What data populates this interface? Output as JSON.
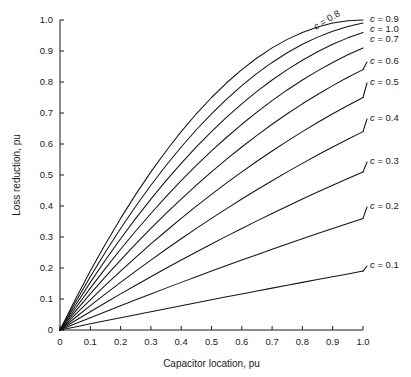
{
  "chart_data": {
    "type": "line",
    "title": "",
    "xlabel": "Capacitor location, pu",
    "ylabel": "Loss reduction, pu",
    "xlim": [
      0,
      1.0
    ],
    "ylim": [
      0,
      1.0
    ],
    "grid": false,
    "legend_position": "right-of-curve-ends",
    "x_ticks": [
      "0",
      "0.1",
      "0.2",
      "0.3",
      "0.4",
      "0.5",
      "0.6",
      "0.7",
      "0.8",
      "0.9",
      "1.0"
    ],
    "x_tick_values": [
      0,
      0.1,
      0.2,
      0.3,
      0.4,
      0.5,
      0.6,
      0.7,
      0.8,
      0.9,
      1.0
    ],
    "y_ticks": [
      "0",
      "0.1",
      "0.2",
      "0.3",
      "0.4",
      "0.5",
      "0.6",
      "0.7",
      "0.8",
      "0.9",
      "1.0"
    ],
    "y_tick_values": [
      0,
      0.1,
      0.2,
      0.3,
      0.4,
      0.5,
      0.6,
      0.7,
      0.8,
      0.9,
      1.0
    ],
    "x": [
      0,
      0.05,
      0.1,
      0.15,
      0.2,
      0.25,
      0.3,
      0.35,
      0.4,
      0.45,
      0.5,
      0.55,
      0.6,
      0.65,
      0.7,
      0.75,
      0.8,
      0.85,
      0.9,
      0.95,
      1.0
    ],
    "series": [
      {
        "name": "c = 0.1",
        "c": 0.1,
        "label": "c = 0.1",
        "label_rotated": false,
        "values": [
          0,
          0.00975,
          0.0199,
          0.02978,
          0.0396,
          0.04938,
          0.0591,
          0.06878,
          0.0784,
          0.08798,
          0.0975,
          0.10698,
          0.1164,
          0.12578,
          0.1351,
          0.14438,
          0.1536,
          0.16278,
          0.1719,
          0.18098,
          0.19
        ]
      },
      {
        "name": "c = 0.2",
        "c": 0.2,
        "label": "c = 0.2",
        "label_rotated": false,
        "values": [
          0,
          0.0199,
          0.0396,
          0.0591,
          0.0784,
          0.0975,
          0.1164,
          0.1351,
          0.1536,
          0.1719,
          0.19,
          0.2079,
          0.2256,
          0.2431,
          0.2604,
          0.2775,
          0.2944,
          0.3111,
          0.3276,
          0.3439,
          0.36
        ]
      },
      {
        "name": "c = 0.3",
        "c": 0.3,
        "label": "c = 0.3",
        "label_rotated": false,
        "values": [
          0,
          0.02985,
          0.0591,
          0.08775,
          0.1158,
          0.14325,
          0.1701,
          0.19635,
          0.222,
          0.24705,
          0.2715,
          0.29535,
          0.3186,
          0.34125,
          0.3633,
          0.38475,
          0.4056,
          0.42585,
          0.4455,
          0.46455,
          0.483
        ]
      },
      {
        "name": "c = 0.4",
        "c": 0.4,
        "label": "c = 0.4",
        "label_rotated": false,
        "values": [
          0,
          0.0396,
          0.0784,
          0.1164,
          0.1536,
          0.19,
          0.2256,
          0.2604,
          0.2944,
          0.3276,
          0.36,
          0.3916,
          0.4224,
          0.4524,
          0.4816,
          0.51,
          0.5376,
          0.5644,
          0.5904,
          0.6156,
          0.64
        ]
      },
      {
        "name": "c = 0.5",
        "c": 0.5,
        "label": "c = 0.5",
        "label_rotated": false,
        "values": [
          0,
          0.04875,
          0.0975,
          0.14325,
          0.19,
          0.23438,
          0.2775,
          0.31938,
          0.36,
          0.39938,
          0.4375,
          0.47438,
          0.51,
          0.54438,
          0.5775,
          0.60938,
          0.64,
          0.66938,
          0.6975,
          0.72438,
          0.75
        ]
      },
      {
        "name": "c = 0.6",
        "c": 0.6,
        "label": "c = 0.6",
        "label_rotated": false,
        "values": [
          0,
          0.0585,
          0.1164,
          0.17385,
          0.2256,
          0.28125,
          0.3336,
          0.38325,
          0.4416,
          0.4779,
          0.525,
          0.5709,
          0.6156,
          0.65915,
          0.7014,
          0.74213,
          0.7824,
          0.8109,
          0.8469,
          0.8819,
          0.84
        ]
      },
      {
        "name": "c = 0.7",
        "c": 0.7,
        "label": "c = 0.7",
        "label_rotated": false,
        "values": [
          0,
          0.06825,
          0.1351,
          0.20055,
          0.2604,
          0.32375,
          0.3801,
          0.44135,
          0.4976,
          0.55125,
          0.6025,
          0.65135,
          0.6996,
          0.74295,
          0.7854,
          0.82575,
          0.8644,
          0.89835,
          0.9324,
          0.96125,
          0.99
        ]
      },
      {
        "name": "c = 0.8",
        "c": 0.8,
        "label": "c = 0.8",
        "label_rotated": true,
        "values": [
          0,
          0.0784,
          0.1536,
          0.2256,
          0.2944,
          0.36,
          0.4224,
          0.4816,
          0.5376,
          0.5904,
          0.64,
          0.6864,
          0.7296,
          0.7696,
          0.8064,
          0.84,
          0.8704,
          0.8976,
          0.9216,
          0.9424,
          0.96
        ]
      },
      {
        "name": "c = 0.9",
        "c": 0.9,
        "label": "c = 0.9",
        "label_rotated": false,
        "values": [
          0,
          0.08775,
          0.1719,
          0.25245,
          0.3294,
          0.40275,
          0.4725,
          0.53865,
          0.6012,
          0.66015,
          0.7155,
          0.76725,
          0.8154,
          0.85995,
          0.9009,
          0.93825,
          0.972,
          1.00215,
          1.0287,
          1.05165,
          1.0
        ]
      },
      {
        "name": "c = 1.0",
        "c": 1.0,
        "label": "c = 1.0",
        "label_rotated": false,
        "values": [
          0,
          0.0975,
          0.19,
          0.2775,
          0.36,
          0.4375,
          0.51,
          0.5775,
          0.64,
          0.6975,
          0.75,
          0.7975,
          0.84,
          0.8775,
          0.91,
          0.9375,
          0.96,
          0.9775,
          0.99,
          0.9975,
          1.0
        ]
      }
    ],
    "colors": {
      "line": "#141414",
      "axis": "#1a1a1a",
      "background": "#ffffff"
    }
  }
}
